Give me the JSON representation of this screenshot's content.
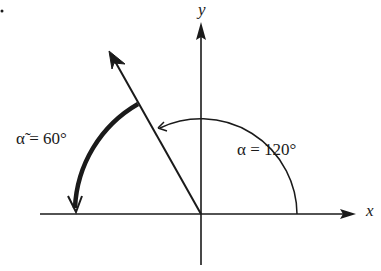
{
  "diagram": {
    "type": "angle-in-standard-position",
    "stray_mark": "·",
    "axes": {
      "x_label": "x",
      "y_label": "y"
    },
    "terminal_side_angle_deg": 120,
    "labels": {
      "alpha": "α = 120°",
      "alpha_ref": "α̃ = 60°"
    },
    "colors": {
      "ink": "#1a1a1a",
      "background": "#ffffff"
    }
  }
}
